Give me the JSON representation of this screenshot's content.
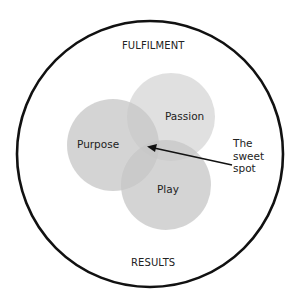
{
  "diagram": {
    "outer_label_top": "FULFILMENT",
    "outer_label_bottom": "RESULTS",
    "circles": [
      {
        "label": "Purpose",
        "cx": 113,
        "cy": 145,
        "r": 46
      },
      {
        "label": "Passion",
        "cx": 171,
        "cy": 117,
        "r": 44
      },
      {
        "label": "Play",
        "cx": 166,
        "cy": 185,
        "r": 45
      }
    ],
    "annotation": {
      "line1": "The",
      "line2": "sweet",
      "line3": "spot"
    },
    "colors": {
      "outer_stroke": "#111111",
      "circle_fill": "#9a9a9a",
      "background": "#ffffff"
    }
  }
}
